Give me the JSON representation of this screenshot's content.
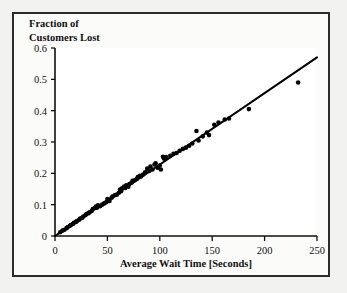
{
  "figure": {
    "background_color": "#f2f2f0",
    "frame_color": "#2b2b2b",
    "plot_background": "#ffffff"
  },
  "chart_data": {
    "type": "scatter",
    "title": "",
    "subtitle": "",
    "xlabel": "Average Wait Time [Seconds]",
    "ylabel": "Fraction of Customers Lost",
    "ylabel_line1": "Fraction of",
    "ylabel_line2": "Customers Lost",
    "xlim": [
      0,
      250
    ],
    "ylim": [
      0,
      0.6
    ],
    "xticks": [
      0,
      50,
      100,
      150,
      200,
      250
    ],
    "yticks": [
      0,
      0.1,
      0.2,
      0.3,
      0.4,
      0.5,
      0.6
    ],
    "xtick_labels": [
      "0",
      "50",
      "100",
      "150",
      "200",
      "250"
    ],
    "ytick_labels": [
      "0",
      "0.1",
      "0.2",
      "0.3",
      "0.4",
      "0.5",
      "0.6"
    ],
    "grid": false,
    "legend": null,
    "annotations": [],
    "marker_color": "#000000",
    "marker_size": 4.6,
    "series": [
      {
        "name": "Customers Lost vs Wait Time",
        "type": "scatter",
        "x": [
          5,
          7,
          9,
          11,
          12,
          14,
          15,
          17,
          18,
          20,
          21,
          23,
          24,
          26,
          27,
          29,
          30,
          32,
          33,
          35,
          36,
          38,
          39,
          40,
          41,
          43,
          45,
          47,
          49,
          50,
          52,
          54,
          55,
          57,
          59,
          61,
          62,
          63,
          64,
          66,
          67,
          68,
          70,
          71,
          73,
          74,
          76,
          78,
          79,
          81,
          82,
          84,
          86,
          88,
          90,
          91,
          93,
          95,
          96,
          98,
          100,
          101,
          103,
          104,
          106,
          110,
          113,
          116,
          119,
          122,
          125,
          128,
          131,
          135,
          137,
          141,
          145,
          147,
          152,
          156,
          162,
          166,
          185,
          232
        ],
        "y": [
          0.012,
          0.017,
          0.02,
          0.025,
          0.028,
          0.032,
          0.035,
          0.038,
          0.042,
          0.045,
          0.048,
          0.052,
          0.056,
          0.058,
          0.062,
          0.066,
          0.07,
          0.073,
          0.076,
          0.08,
          0.086,
          0.089,
          0.094,
          0.09,
          0.098,
          0.095,
          0.1,
          0.104,
          0.108,
          0.118,
          0.112,
          0.122,
          0.126,
          0.13,
          0.132,
          0.138,
          0.148,
          0.143,
          0.152,
          0.158,
          0.153,
          0.162,
          0.157,
          0.166,
          0.17,
          0.176,
          0.178,
          0.182,
          0.188,
          0.192,
          0.19,
          0.196,
          0.203,
          0.215,
          0.208,
          0.222,
          0.212,
          0.228,
          0.232,
          0.218,
          0.225,
          0.212,
          0.253,
          0.247,
          0.252,
          0.256,
          0.262,
          0.265,
          0.272,
          0.278,
          0.282,
          0.288,
          0.295,
          0.335,
          0.305,
          0.318,
          0.33,
          0.322,
          0.355,
          0.362,
          0.372,
          0.375,
          0.405,
          0.49
        ]
      }
    ],
    "fit_line": {
      "name": "linear fit",
      "type": "line",
      "slope": 0.00228,
      "intercept": 0.0,
      "x": [
        0,
        250
      ],
      "y": [
        0.0,
        0.57
      ],
      "color": "#000000"
    }
  }
}
